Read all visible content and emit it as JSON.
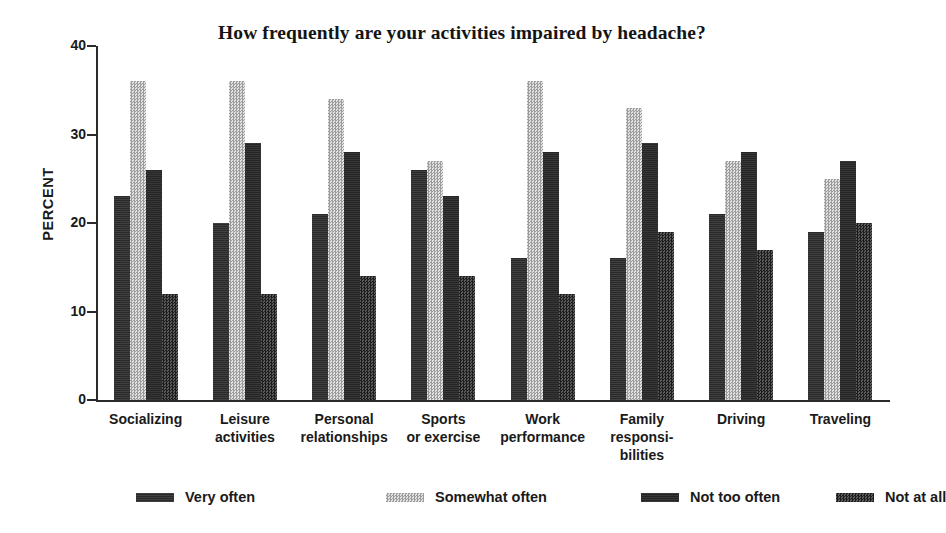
{
  "chart_data": {
    "type": "bar",
    "title": "How frequently are your activities impaired by headache?",
    "xlabel": "",
    "ylabel": "PERCENT",
    "ylim": [
      0,
      40
    ],
    "yticks": [
      "0",
      "10",
      "20",
      "30",
      "40"
    ],
    "grid": false,
    "legend_position": "bottom",
    "categories": [
      "Socializing",
      "Leisure activities",
      "Personal relationships",
      "Sports or exercise",
      "Work performance",
      "Family responsi-bilities",
      "Driving",
      "Traveling"
    ],
    "category_lines": [
      [
        "Socializing"
      ],
      [
        "Leisure",
        "activities"
      ],
      [
        "Personal",
        "relationships"
      ],
      [
        "Sports",
        "or exercise"
      ],
      [
        "Work",
        "performance"
      ],
      [
        "Family",
        "responsi-",
        "bilities"
      ],
      [
        "Driving"
      ],
      [
        "Traveling"
      ]
    ],
    "series": [
      {
        "name": "Very often",
        "color": "#2a2a2a",
        "pattern": "solid-dark",
        "values": [
          23,
          20,
          21,
          26,
          16,
          16,
          21,
          19
        ]
      },
      {
        "name": "Somewhat often",
        "color": "#cfcfcf",
        "pattern": "light-stipple",
        "values": [
          36,
          36,
          34,
          27,
          36,
          33,
          27,
          25
        ]
      },
      {
        "name": "Not too often",
        "color": "#262626",
        "pattern": "solid-dark",
        "values": [
          26,
          29,
          28,
          23,
          28,
          29,
          28,
          27
        ]
      },
      {
        "name": "Not at all",
        "color": "#3a3a3a",
        "pattern": "dark-checker",
        "values": [
          12,
          12,
          14,
          14,
          12,
          19,
          17,
          20
        ]
      }
    ]
  },
  "legend": {
    "items": [
      {
        "label": "Very often"
      },
      {
        "label": "Somewhat often"
      },
      {
        "label": "Not too often"
      },
      {
        "label": "Not at all"
      }
    ]
  }
}
